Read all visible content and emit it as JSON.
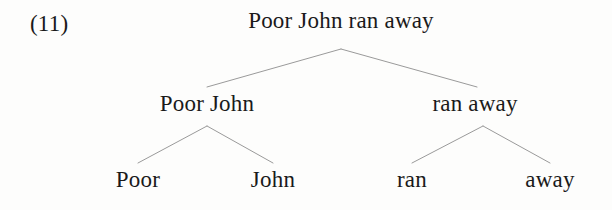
{
  "figure": {
    "example_number": "(11)",
    "background_color": "#fdfdfc",
    "text_color": "#1a1a1a",
    "branch_color": "#9a9a9a"
  },
  "tree": {
    "root": {
      "label": "Poor John ran away",
      "x": 341,
      "baseline_y": 30
    },
    "level2": [
      {
        "label": "Poor John",
        "x": 207,
        "baseline_y": 113
      },
      {
        "label": "ran away",
        "x": 475,
        "baseline_y": 113
      }
    ],
    "leaves": [
      {
        "label": "Poor",
        "x": 138,
        "baseline_y": 189
      },
      {
        "label": "John",
        "x": 273,
        "baseline_y": 189
      },
      {
        "label": "ran",
        "x": 412,
        "baseline_y": 189
      },
      {
        "label": "away",
        "x": 550,
        "baseline_y": 189
      }
    ],
    "branches": [
      {
        "name": "root-to-np",
        "x1": 341,
        "y1": 49,
        "x2": 207,
        "y2": 87
      },
      {
        "name": "root-to-vp",
        "x1": 341,
        "y1": 49,
        "x2": 477,
        "y2": 87
      },
      {
        "name": "np-to-poor",
        "x1": 207,
        "y1": 126,
        "x2": 138,
        "y2": 163
      },
      {
        "name": "np-to-john",
        "x1": 207,
        "y1": 126,
        "x2": 273,
        "y2": 163
      },
      {
        "name": "vp-to-ran",
        "x1": 483,
        "y1": 126,
        "x2": 412,
        "y2": 163
      },
      {
        "name": "vp-to-away",
        "x1": 483,
        "y1": 126,
        "x2": 550,
        "y2": 163
      }
    ]
  }
}
